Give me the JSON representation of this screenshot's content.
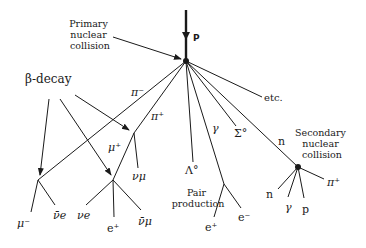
{
  "diagram": {
    "incoming": {
      "label": "P"
    },
    "primary": {
      "label_lines": [
        "Primary",
        "nuclear",
        "collision"
      ]
    },
    "beta_decay": {
      "label": "β-decay"
    },
    "tracks": {
      "pi_minus": "π⁻",
      "pi_plus": "π⁺",
      "mu_plus": "μ⁺",
      "nu_mu": "νμ",
      "lambda0": "Λ°",
      "gamma": "γ",
      "sigma0": "Σ°",
      "n": "n",
      "etc": "etc."
    },
    "decay_products": {
      "mu_minus": "μ⁻",
      "anti_nu_e": "ν̄e",
      "nu_e": "νe",
      "e_plus_beta": "e⁺",
      "anti_nu_mu": "ν̄μ"
    },
    "pair_production": {
      "label_lines": [
        "Pair",
        "production"
      ],
      "e_plus": "e⁺",
      "e_minus": "e⁻"
    },
    "secondary": {
      "label_lines": [
        "Secondary",
        "nuclear",
        "collision"
      ],
      "n": "n",
      "gamma": "γ",
      "p": "p",
      "pi_plus": "π⁺"
    }
  }
}
